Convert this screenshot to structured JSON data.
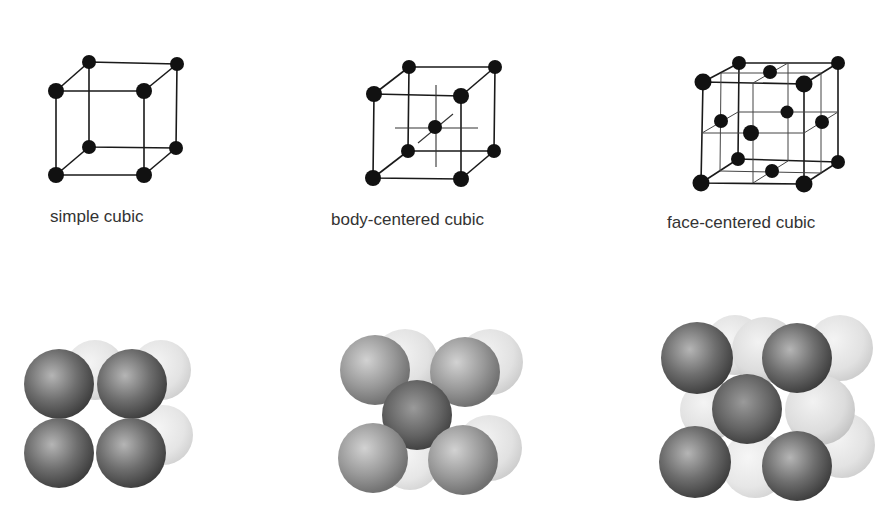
{
  "figures": [
    {
      "id": "simple-cubic",
      "label": "simple cubic",
      "atoms_per_cell_shown": 8,
      "wireframe": {
        "corners": [
          [
            56,
            91
          ],
          [
            144,
            91
          ],
          [
            56,
            175
          ],
          [
            144,
            175
          ],
          [
            89,
            62
          ],
          [
            177,
            64
          ],
          [
            89,
            147
          ],
          [
            176,
            148
          ]
        ],
        "extra_atoms": []
      }
    },
    {
      "id": "body-centered-cubic",
      "label": "body-centered cubic",
      "atoms_per_cell_shown": 9,
      "wireframe": {
        "corners": [
          [
            374,
            94
          ],
          [
            461,
            96
          ],
          [
            373,
            178
          ],
          [
            461,
            179
          ],
          [
            409,
            67
          ],
          [
            495,
            67
          ],
          [
            408,
            151
          ],
          [
            494,
            151
          ]
        ],
        "extra_atoms": [
          [
            435,
            127
          ]
        ]
      }
    },
    {
      "id": "face-centered-cubic",
      "label": "face-centered cubic",
      "atoms_per_cell_shown": 14,
      "wireframe": {
        "corners": [
          [
            703,
            82
          ],
          [
            804,
            84
          ],
          [
            701,
            183
          ],
          [
            804,
            184
          ],
          [
            739,
            63
          ],
          [
            838,
            63
          ],
          [
            738,
            159
          ],
          [
            838,
            162
          ]
        ],
        "extra_atoms": [
          [
            770,
            72
          ],
          [
            751,
            133
          ],
          [
            721,
            121
          ],
          [
            822,
            122
          ],
          [
            787,
            112
          ],
          [
            772,
            171
          ]
        ]
      }
    }
  ],
  "colors": {
    "line": "#1a1a1a",
    "atom": "#111111",
    "sphere_dark": "#4a4a4a",
    "sphere_mid": "#8a8a8a",
    "sphere_light": "#d8d8d8",
    "caption": "#333333"
  }
}
